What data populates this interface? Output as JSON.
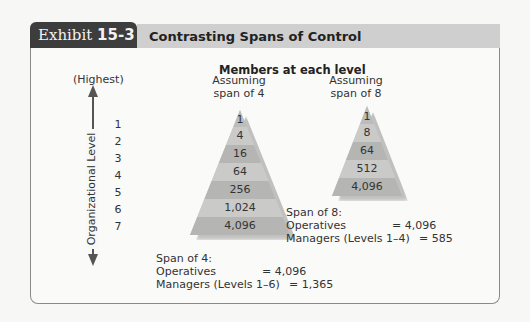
{
  "header": {
    "exhibit_label": "Exhibit",
    "exhibit_number": "15-3",
    "title": "Contrasting Spans of Control"
  },
  "diagram": {
    "members_title": "Members at each level",
    "axis": {
      "top_label": "(Highest)",
      "label": "Organizational Level",
      "levels": [
        "1",
        "2",
        "3",
        "4",
        "5",
        "6",
        "7"
      ],
      "arrow_up_icon": "arrow-up",
      "arrow_down_icon": "arrow-down"
    },
    "span4": {
      "heading_line1": "Assuming",
      "heading_line2": "span of 4",
      "bands": [
        "1",
        "4",
        "16",
        "64",
        "256",
        "1,024",
        "4,096"
      ],
      "summary_title": "Span of 4:",
      "operatives_label": "Operatives",
      "operatives_value": "= 4,096",
      "managers_label": "Managers (Levels 1–6)",
      "managers_value": "= 1,365"
    },
    "span8": {
      "heading_line1": "Assuming",
      "heading_line2": "span of 8",
      "bands": [
        "1",
        "8",
        "64",
        "512",
        "4,096"
      ],
      "summary_title": "Span of 8:",
      "operatives_label": "Operatives",
      "operatives_value": "= 4,096",
      "managers_label": "Managers (Levels 1–4)",
      "managers_value": "= 585"
    },
    "colors": {
      "band_light": "#c9c9c7",
      "band_dark": "#b3b3b1",
      "tab_dark": "#3d3d3d",
      "title_bar": "#cfcfcf"
    }
  }
}
